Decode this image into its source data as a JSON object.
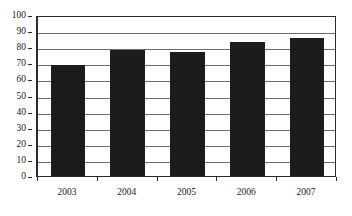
{
  "chart_data": {
    "type": "bar",
    "title": "",
    "subtitle": "",
    "xlabel": "",
    "ylabel": "",
    "categories": [
      "2003",
      "2004",
      "2005",
      "2006",
      "2007"
    ],
    "values": [
      69,
      78,
      77,
      83,
      86
    ],
    "series": [
      {
        "name": "",
        "values": [
          69,
          78,
          77,
          83,
          86
        ]
      }
    ],
    "ylim": [
      0,
      100
    ],
    "yticks": [
      0,
      10,
      20,
      30,
      40,
      50,
      60,
      70,
      80,
      90,
      100
    ],
    "ytick_labels": [
      "0",
      "10",
      "20",
      "30",
      "40",
      "50",
      "60",
      "70",
      "80",
      "90",
      "100"
    ],
    "grid": true,
    "grid_axis": "y",
    "legend": false,
    "legend_position": "none",
    "annotations": [],
    "colors": {
      "bar": "#1c1c1c",
      "gridline": "#6e6e6e",
      "axis": "#2b2b2b",
      "plot_background": "#ffffff",
      "figure_background": "#ffffff",
      "text": "#1a1a1a"
    }
  }
}
